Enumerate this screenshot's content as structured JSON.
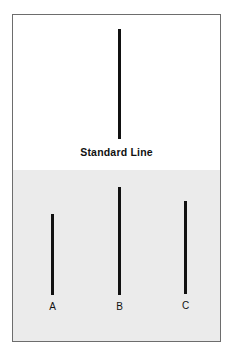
{
  "figure": {
    "panels": [
      {
        "id": "standard",
        "caption": "Standard Line",
        "background_color": "#ffffff"
      },
      {
        "id": "comparison",
        "caption": "Comparison Lines",
        "background_color": "#ebebeb"
      }
    ],
    "line_color": "#111111",
    "border_color": "#6d6d6d"
  },
  "chart_data": {
    "type": "bar",
    "subtitle": "",
    "xlabel": "",
    "ylabel": "Line length (px)",
    "orientation": "vertical",
    "grid": false,
    "legend": false,
    "categories": [
      "Standard",
      "A",
      "B",
      "C"
    ],
    "values": [
      110,
      81,
      108,
      93
    ],
    "ylim": [
      0,
      120
    ],
    "annotations": [
      "Standard Line",
      "Comparison Lines"
    ],
    "series": [
      {
        "name": "Line length",
        "values": [
          110,
          81,
          108,
          93
        ]
      }
    ]
  },
  "standard_line": {
    "label": "",
    "left_px": 105,
    "top_px": 14,
    "length_px": 110
  },
  "comparison_lines": [
    {
      "label": "A",
      "left_px": 38,
      "top_px": 199,
      "length_px": 81
    },
    {
      "label": "B",
      "left_px": 105,
      "top_px": 172,
      "length_px": 108
    },
    {
      "label": "C",
      "left_px": 171,
      "top_px": 186,
      "length_px": 93
    }
  ]
}
